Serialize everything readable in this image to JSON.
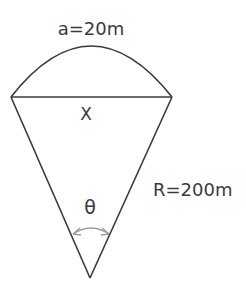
{
  "diagram": {
    "type": "circular sector with chord",
    "labels": {
      "arc_length": "a=20m",
      "chord": "X",
      "angle": "θ",
      "radius": "R=200m"
    },
    "colors": {
      "stroke": "#3a3a3a",
      "angle_marker": "#9a9a9a",
      "background": "#ffffff"
    }
  }
}
